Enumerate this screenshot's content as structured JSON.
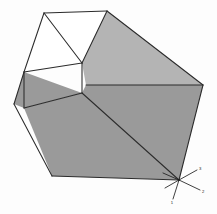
{
  "figure": {
    "background_color": "#fdfdfd",
    "edge_color": "#2b2b2b",
    "edge_width": 1.05,
    "faces": [
      {
        "name": "top-left-notch-face",
        "fill": "#ffffff",
        "points": "44,13 107,11 82,63 24,72"
      },
      {
        "name": "top-right-face",
        "fill": "#b4b4b4",
        "points": "107,11 203,85 86,85 82,63"
      },
      {
        "name": "front-right-face",
        "fill": "#9a9a9a",
        "points": "86,85 203,85 179,180 82,93"
      },
      {
        "name": "front-bottom-face",
        "fill": "#9a9a9a",
        "points": "82,93 179,180 52,176 24,108"
      },
      {
        "name": "left-lower-face",
        "fill": "#9a9a9a",
        "points": "24,72 82,93 24,108 14,104"
      }
    ],
    "edges": [
      {
        "name": "top-rear-edge",
        "x1": 44,
        "y1": 13,
        "x2": 107,
        "y2": 11
      },
      {
        "name": "notch-left-edge",
        "x1": 44,
        "y1": 13,
        "x2": 82,
        "y2": 63
      },
      {
        "name": "notch-right-edge",
        "x1": 82,
        "y1": 63,
        "x2": 107,
        "y2": 11
      },
      {
        "name": "left-upper-edge",
        "x1": 44,
        "y1": 13,
        "x2": 24,
        "y2": 72
      },
      {
        "name": "notch-floor-edge",
        "x1": 24,
        "y1": 72,
        "x2": 82,
        "y2": 63
      },
      {
        "name": "top-right-diagonal",
        "x1": 107,
        "y1": 11,
        "x2": 203,
        "y2": 85
      },
      {
        "name": "horizon-edge",
        "x1": 86,
        "y1": 85,
        "x2": 203,
        "y2": 85
      },
      {
        "name": "center-vertical-edge",
        "x1": 82,
        "y1": 63,
        "x2": 82,
        "y2": 93
      },
      {
        "name": "left-vertical-edge",
        "x1": 24,
        "y1": 72,
        "x2": 24,
        "y2": 108
      },
      {
        "name": "left-notch-side-edge",
        "x1": 14,
        "y1": 104,
        "x2": 24,
        "y2": 72
      },
      {
        "name": "left-outer-lower-edge",
        "x1": 14,
        "y1": 104,
        "x2": 52,
        "y2": 176
      },
      {
        "name": "bottom-front-edge",
        "x1": 52,
        "y1": 176,
        "x2": 179,
        "y2": 180
      },
      {
        "name": "right-outer-edge",
        "x1": 203,
        "y1": 85,
        "x2": 179,
        "y2": 180
      },
      {
        "name": "center-to-bottom-right-diagonal",
        "x1": 82,
        "y1": 93,
        "x2": 179,
        "y2": 180
      },
      {
        "name": "center-to-left-edge",
        "x1": 82,
        "y1": 93,
        "x2": 24,
        "y2": 108
      }
    ]
  },
  "axis_indicator": {
    "name": "coordinate-axis-triad",
    "origin_x": 179,
    "origin_y": 180,
    "color": "#1f1f1f",
    "axes": [
      {
        "label": "3",
        "x2": 197,
        "y2": 170
      },
      {
        "label": "2",
        "x2": 200,
        "y2": 190
      },
      {
        "label": "1",
        "x2": 173,
        "y2": 199
      },
      {
        "label": "",
        "x2": 163,
        "y2": 173
      },
      {
        "label": "",
        "x2": 165,
        "y2": 188
      }
    ]
  }
}
